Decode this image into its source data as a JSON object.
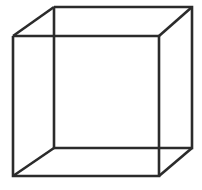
{
  "figure": {
    "name": "Necker cube",
    "type": "wireframe-line-drawing",
    "canvas": {
      "width": 202,
      "height": 190,
      "background_color": "#ffffff"
    },
    "style": {
      "stroke_color": "#2b2b2b",
      "stroke_width": 2.6,
      "fill": "none"
    },
    "vertices": {
      "front_top_left": {
        "x": 13,
        "y": 36
      },
      "front_top_right": {
        "x": 159,
        "y": 36
      },
      "front_bottom_right": {
        "x": 159,
        "y": 176
      },
      "front_bottom_left": {
        "x": 13,
        "y": 176
      },
      "back_top_left": {
        "x": 54,
        "y": 7
      },
      "back_top_right": {
        "x": 192,
        "y": 7
      },
      "back_bottom_right": {
        "x": 192,
        "y": 148
      },
      "back_bottom_left": {
        "x": 54,
        "y": 148
      }
    },
    "edges": [
      {
        "name": "front-face-square",
        "points": "13,36 159,36 159,176 13,176 13,36"
      },
      {
        "name": "back-face-square",
        "points": "54,7 192,7 192,148 54,148 54,7"
      },
      {
        "name": "connector-top-left",
        "points": "13,36 54,7"
      },
      {
        "name": "connector-top-right",
        "points": "159,36 192,7"
      },
      {
        "name": "connector-bottom-right",
        "points": "159,176 192,148"
      },
      {
        "name": "connector-bottom-left",
        "points": "13,176 54,148"
      }
    ]
  }
}
